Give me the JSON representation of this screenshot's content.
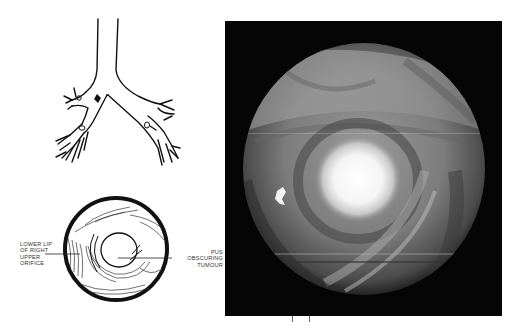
{
  "figure": {
    "type": "medical-illustration",
    "panels": {
      "bronchial_tree": {
        "description": "Line drawing of trachea and bronchial tree with arrow marking right upper lobe orifice"
      },
      "scope_diagram": {
        "description": "Circular schematic of bronchoscopic view",
        "labels": {
          "left": [
            "LOWER LIP",
            "OF RIGHT",
            "UPPER",
            "ORIFICE"
          ],
          "right": [
            "PUS",
            "OBSCURING",
            "TUMOUR"
          ]
        }
      },
      "photo": {
        "description": "Bronchoscopic photograph showing circular endoscopic view with bright white area of pus obscuring tumour",
        "background_color": "#050505",
        "highlight_color": "#f5f5f5"
      }
    }
  }
}
